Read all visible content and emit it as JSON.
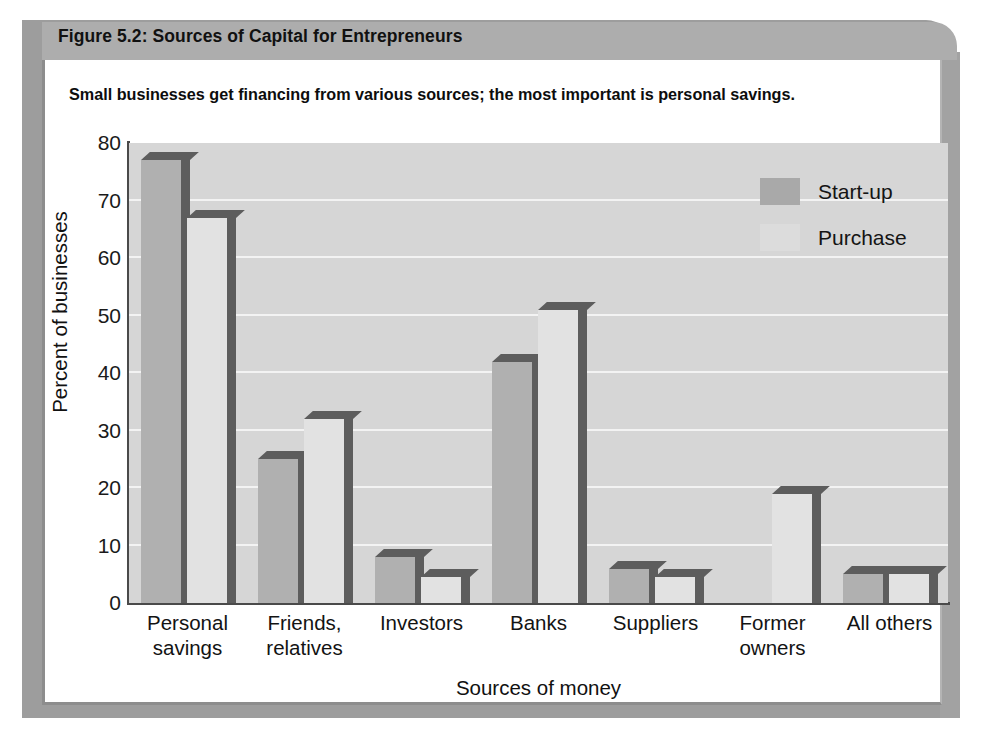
{
  "figure": {
    "title": "Figure 5.2: Sources of Capital for Entrepreneurs",
    "subtitle": "Small businesses get financing from various sources; the most important is personal savings."
  },
  "colors": {
    "header_band": "#adadad",
    "plot_background": "#d6d6d6",
    "gridline": "#f3f3f3",
    "startup_bar": "#b0b0b0",
    "purchase_bar": "#e2e2e2",
    "bar_shadow": "#5d5d5d",
    "axis": "#4a4a4a",
    "text": "#111111"
  },
  "chart_data": {
    "type": "bar",
    "title": "Figure 5.2: Sources of Capital for Entrepreneurs",
    "subtitle": "Small businesses get financing from various sources; the most important is personal savings.",
    "xlabel": "Sources of money",
    "ylabel": "Percent of businesses",
    "ylim": [
      0,
      80
    ],
    "yticks": [
      0,
      10,
      20,
      30,
      40,
      50,
      60,
      70,
      80
    ],
    "ytick_labels": [
      "0",
      "10",
      "20",
      "30",
      "40",
      "50",
      "60",
      "70",
      "80"
    ],
    "grid": true,
    "grid_axis": "y",
    "legend_position": "top-right",
    "categories": [
      "Personal savings",
      "Friends, relatives",
      "Investors",
      "Banks",
      "Suppliers",
      "Former owners",
      "All others"
    ],
    "category_lines": [
      [
        "Personal",
        "savings"
      ],
      [
        "Friends,",
        "relatives"
      ],
      [
        "Investors"
      ],
      [
        "Banks"
      ],
      [
        "Suppliers"
      ],
      [
        "Former",
        "owners"
      ],
      [
        "All others"
      ]
    ],
    "series": [
      {
        "name": "Start-up",
        "values": [
          77,
          25,
          8,
          42,
          6,
          0,
          5
        ]
      },
      {
        "name": "Purchase",
        "values": [
          67,
          32,
          4.5,
          51,
          4.5,
          19,
          5
        ]
      }
    ]
  }
}
